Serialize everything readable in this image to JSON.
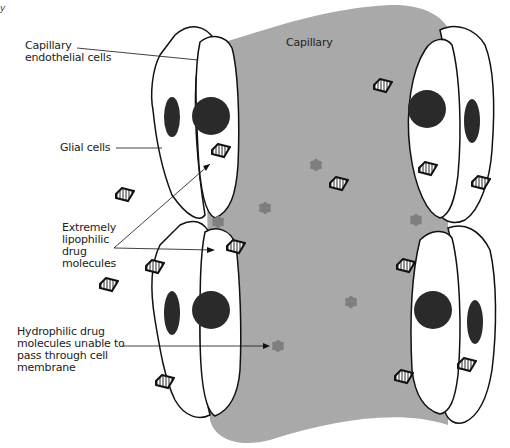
{
  "diagram": {
    "corner_text": "y",
    "capillary_label": "Capillary",
    "labels": {
      "endothelial": "Capillary\nendothelial cells",
      "glial": "Glial cells",
      "lipophilic": "Extremely\nlipophilic\ndrug\nmolecules",
      "hydrophilic": "Hydrophilic drug\nmolecules unable to\npass through cell\nmembrane"
    },
    "colors": {
      "capillary_fill": "#a9a9a9",
      "cell_fill": "#ffffff",
      "nucleus": "#2a2a2a",
      "hydrophilic_molecule": "#7f7f7f",
      "outline": "#111111"
    },
    "hydrophilic_molecules": [
      {
        "x": 265,
        "y": 208
      },
      {
        "x": 316,
        "y": 165
      },
      {
        "x": 218,
        "y": 222
      },
      {
        "x": 416,
        "y": 220
      },
      {
        "x": 351,
        "y": 302
      },
      {
        "x": 278,
        "y": 346
      }
    ],
    "lipophilic_molecules": [
      {
        "x": 221,
        "y": 151,
        "rot": -15
      },
      {
        "x": 125,
        "y": 195,
        "rot": -15
      },
      {
        "x": 339,
        "y": 184,
        "rot": -15
      },
      {
        "x": 383,
        "y": 86,
        "rot": -15
      },
      {
        "x": 428,
        "y": 169,
        "rot": -15
      },
      {
        "x": 481,
        "y": 183,
        "rot": -15
      },
      {
        "x": 236,
        "y": 247,
        "rot": -15
      },
      {
        "x": 155,
        "y": 267,
        "rot": -15
      },
      {
        "x": 109,
        "y": 285,
        "rot": -15
      },
      {
        "x": 406,
        "y": 266,
        "rot": -15
      },
      {
        "x": 467,
        "y": 365,
        "rot": -15
      },
      {
        "x": 404,
        "y": 377,
        "rot": -15
      },
      {
        "x": 165,
        "y": 382,
        "rot": -15
      }
    ]
  }
}
